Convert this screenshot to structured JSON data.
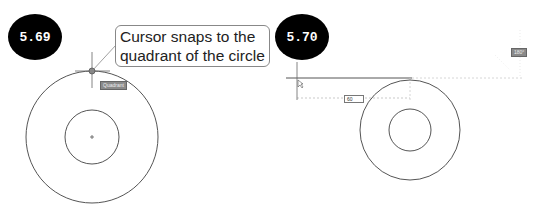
{
  "figures": [
    {
      "label": "5.69",
      "callout_line1": "Cursor snaps to the",
      "callout_line2": "quadrant of the circle",
      "snap_tooltip": "Quadrant"
    },
    {
      "label": "5.70",
      "distance_input": "60",
      "angle_tooltip": "180°"
    }
  ],
  "colors": {
    "badge_bg": "#000000",
    "badge_text": "#ffffff",
    "geometry": "#555555",
    "tooltip_bg": "#8a8a8a",
    "tracking": "#bbbbbb"
  }
}
